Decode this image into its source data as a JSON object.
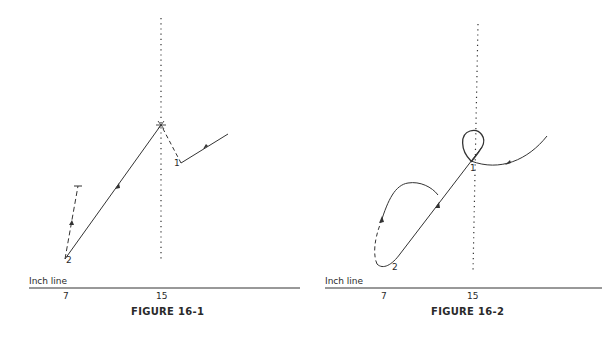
{
  "figures": [
    {
      "caption": "FIGURE 16-1",
      "inch_line_label": "Inch line",
      "ticks": [
        "7",
        "15"
      ],
      "point_labels": [
        "1",
        "2"
      ]
    },
    {
      "caption": "FIGURE 16-2",
      "inch_line_label": "Inch line",
      "ticks": [
        "7",
        "15"
      ],
      "point_labels": [
        "1",
        "2"
      ]
    }
  ],
  "colors": {
    "ink": "#2a2a2a",
    "background": "#ffffff"
  }
}
